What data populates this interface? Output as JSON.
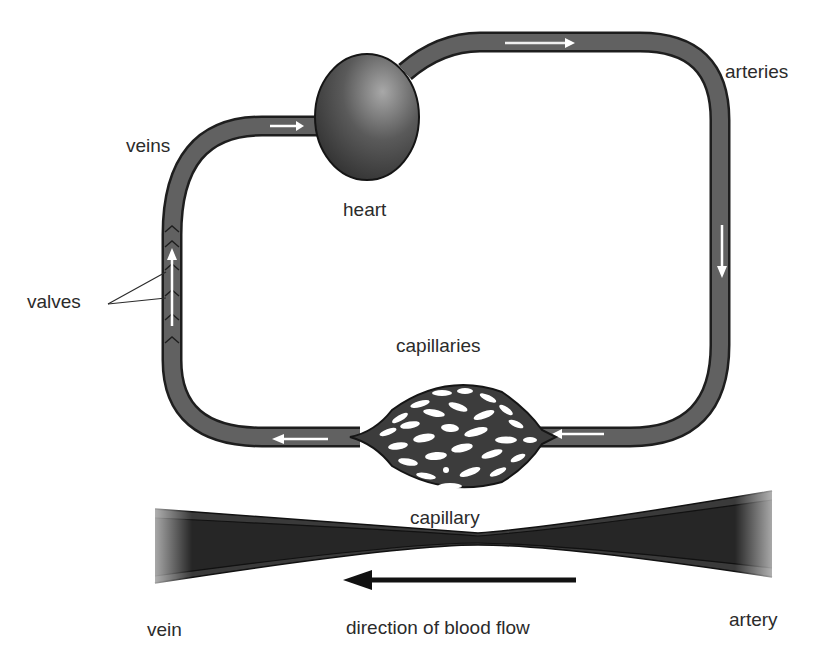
{
  "diagram": {
    "labels": {
      "veins": "veins",
      "heart": "heart",
      "arteries": "arteries",
      "valves": "valves",
      "capillaries": "capillaries",
      "capillary": "capillary",
      "vein": "vein",
      "artery": "artery",
      "direction": "direction of blood flow"
    },
    "colors": {
      "vessel_fill": "#5f5f5f",
      "vessel_outline": "#1e1e1e",
      "heart_light": "#9a9a9a",
      "heart_dark": "#2e2e2e",
      "flow_arrow": "#ffffff",
      "direction_arrow": "#111111",
      "text": "#2b2b2b"
    }
  }
}
